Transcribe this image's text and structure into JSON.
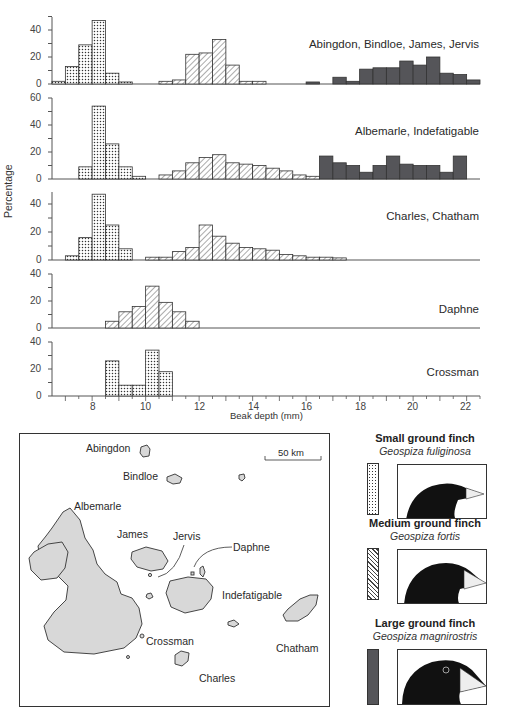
{
  "figure": {
    "y_axis_label": "Percentage",
    "x_axis_label": "Beak depth (mm)",
    "x_ticks": [
      "8",
      "10",
      "12",
      "14",
      "16",
      "18",
      "20",
      "22"
    ]
  },
  "panels": [
    {
      "label": "Abingdon, Bindloe, James, Jervis",
      "y_ticks": [
        "40",
        "20",
        "0"
      ]
    },
    {
      "label": "Albemarle, Indefatigable",
      "y_ticks": [
        "60",
        "40",
        "20",
        "0"
      ]
    },
    {
      "label": "Charles, Chatham",
      "y_ticks": [
        "40",
        "20",
        "0"
      ]
    },
    {
      "label": "Daphne",
      "y_ticks": [
        "40",
        "20",
        "0"
      ]
    },
    {
      "label": "Crossman",
      "y_ticks": [
        "40",
        "20",
        "0"
      ]
    }
  ],
  "map": {
    "scale_label": "50 km",
    "islands": {
      "abingdon": "Abingdon",
      "bindloe": "Bindloe",
      "albemarle": "Albemarle",
      "james": "James",
      "jervis": "Jervis",
      "daphne": "Daphne",
      "indefatigable": "Indefatigable",
      "crossman": "Crossman",
      "chatham": "Chatham",
      "charles": "Charles"
    }
  },
  "legend": [
    {
      "common": "Small ground finch",
      "scientific": "Geospiza fuliginosa",
      "pattern": "dotted"
    },
    {
      "common": "Medium ground finch",
      "scientific": "Geospiza fortis",
      "pattern": "hatched"
    },
    {
      "common": "Large ground finch",
      "scientific": "Geospiza magnirostris",
      "pattern": "solid"
    }
  ],
  "colors": {
    "dark_fill": "#555559",
    "axis": "#555555",
    "island_fill": "#d8d8d8"
  },
  "chart_data": {
    "type": "bar",
    "xlabel": "Beak depth (mm)",
    "ylabel": "Percentage",
    "xlim": [
      6.5,
      22.5
    ],
    "bin_width_mm": 0.5,
    "panels": [
      {
        "label": "Abingdon, Bindloe, James, Jervis",
        "ylim": [
          0,
          50
        ],
        "series": [
          {
            "name": "Small ground finch",
            "pattern": "dotted",
            "start": 6.5,
            "values": [
              2,
              13,
              29,
              47,
              8,
              1.5
            ]
          },
          {
            "name": "Medium ground finch",
            "pattern": "hatched",
            "start": 10.5,
            "values": [
              2,
              3,
              22,
              23,
              33,
              14,
              2,
              2
            ]
          },
          {
            "name": "Large ground finch",
            "pattern": "solid",
            "start": 16.0,
            "values": [
              1.5,
              0,
              5,
              2,
              11,
              12,
              12,
              17,
              14,
              20,
              8,
              7,
              3
            ]
          }
        ]
      },
      {
        "label": "Albemarle, Indefatigable",
        "ylim": [
          0,
          60
        ],
        "series": [
          {
            "name": "Small ground finch",
            "pattern": "dotted",
            "start": 7.5,
            "values": [
              9,
              54,
              26,
              9,
              2
            ]
          },
          {
            "name": "Medium ground finch",
            "pattern": "hatched",
            "start": 10.5,
            "values": [
              3,
              6,
              12,
              16,
              18,
              12,
              11,
              10,
              8,
              6,
              3,
              2
            ]
          },
          {
            "name": "Large ground finch",
            "pattern": "solid",
            "start": 16.5,
            "values": [
              17,
              12,
              10,
              5,
              10,
              17,
              11,
              10,
              10,
              5,
              17
            ]
          }
        ]
      },
      {
        "label": "Charles, Chatham",
        "ylim": [
          0,
          50
        ],
        "series": [
          {
            "name": "Small ground finch",
            "pattern": "dotted",
            "start": 7.0,
            "values": [
              3,
              16,
              47,
              25,
              8
            ]
          },
          {
            "name": "Medium ground finch",
            "pattern": "hatched",
            "start": 10.0,
            "values": [
              2,
              2,
              6,
              9,
              25,
              17,
              12,
              9,
              8,
              7,
              4,
              3,
              2,
              2,
              1.5
            ]
          }
        ]
      },
      {
        "label": "Daphne",
        "ylim": [
          0,
          40
        ],
        "series": [
          {
            "name": "Medium ground finch",
            "pattern": "hatched",
            "start": 8.5,
            "values": [
              5,
              12,
              16,
              31,
              19,
              12,
              5
            ]
          }
        ]
      },
      {
        "label": "Crossman",
        "ylim": [
          0,
          40
        ],
        "series": [
          {
            "name": "Small ground finch",
            "pattern": "dotted",
            "start": 8.5,
            "values": [
              26,
              8,
              8,
              34,
              18
            ]
          }
        ]
      }
    ]
  }
}
